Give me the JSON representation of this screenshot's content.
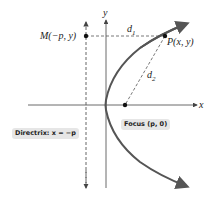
{
  "diagram": {
    "axes": {
      "x_label": "x",
      "y_label": "y"
    },
    "points": {
      "M": {
        "label": "M(−p, y)"
      },
      "P": {
        "label": "P(x, y)"
      }
    },
    "distances": {
      "d1": "d",
      "d1_sub": "1",
      "d2": "d",
      "d2_sub": "2"
    },
    "tags": {
      "directrix": "Directrix: x = −p",
      "focus": "Focus (p, 0)"
    },
    "colors": {
      "curve": "#555555",
      "axis": "#444444",
      "dashed": "#555555",
      "tag_bg": "#e6e6e6"
    }
  }
}
